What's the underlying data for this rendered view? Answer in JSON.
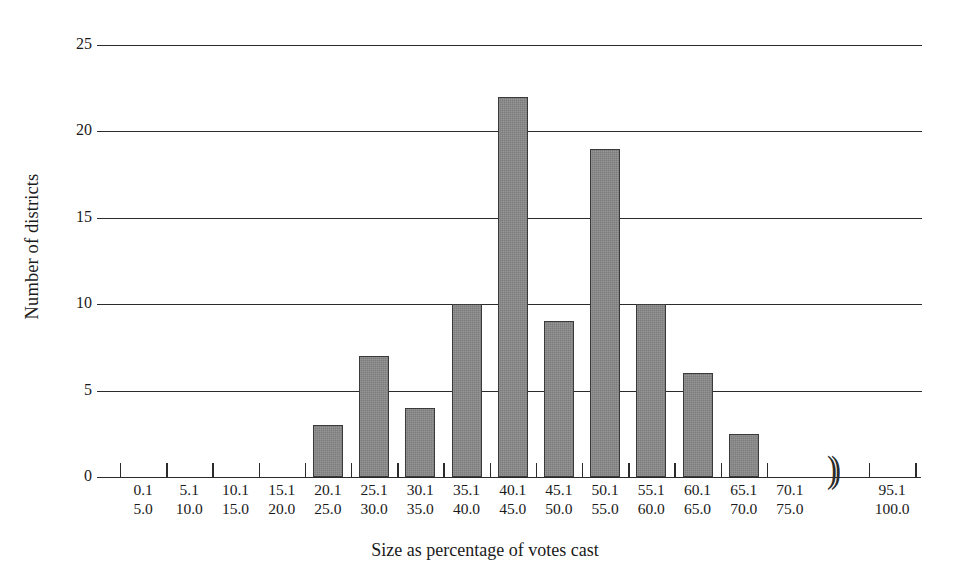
{
  "chart_data": {
    "type": "bar",
    "title": "",
    "xlabel": "Size as percentage of votes cast",
    "ylabel": "Number of districts",
    "ylim": [
      0,
      25
    ],
    "yticks": [
      0,
      5,
      10,
      15,
      20,
      25
    ],
    "grid": true,
    "legend": null,
    "axis_break": {
      "symbol": "))",
      "between": [
        "70.1–75.0",
        "95.1–100.0"
      ]
    },
    "categories": [
      "0.1\n5.0",
      "5.1\n10.0",
      "10.1\n15.0",
      "15.1\n20.0",
      "20.1\n25.0",
      "25.1\n30.0",
      "30.1\n35.0",
      "35.1\n40.0",
      "40.1\n45.0",
      "45.1\n50.0",
      "50.1\n55.0",
      "55.1\n60.0",
      "60.1\n65.0",
      "65.1\n70.0",
      "70.1\n75.0",
      "95.1\n100.0"
    ],
    "values": [
      0,
      0,
      0,
      0,
      3,
      7,
      4,
      10,
      22,
      9,
      19,
      10,
      6,
      2.5,
      0,
      0
    ],
    "bins": [
      {
        "lower": "0.1",
        "upper": "5.0",
        "value": 0
      },
      {
        "lower": "5.1",
        "upper": "10.0",
        "value": 0
      },
      {
        "lower": "10.1",
        "upper": "15.0",
        "value": 0
      },
      {
        "lower": "15.1",
        "upper": "20.0",
        "value": 0
      },
      {
        "lower": "20.1",
        "upper": "25.0",
        "value": 3
      },
      {
        "lower": "25.1",
        "upper": "30.0",
        "value": 7
      },
      {
        "lower": "30.1",
        "upper": "35.0",
        "value": 4
      },
      {
        "lower": "35.1",
        "upper": "40.0",
        "value": 10
      },
      {
        "lower": "40.1",
        "upper": "45.0",
        "value": 22
      },
      {
        "lower": "45.1",
        "upper": "50.0",
        "value": 9
      },
      {
        "lower": "50.1",
        "upper": "55.0",
        "value": 19
      },
      {
        "lower": "55.1",
        "upper": "60.0",
        "value": 10
      },
      {
        "lower": "60.1",
        "upper": "65.0",
        "value": 6
      },
      {
        "lower": "65.1",
        "upper": "70.0",
        "value": 2.5
      },
      {
        "lower": "70.1",
        "upper": "75.0",
        "value": 0
      },
      {
        "lower": "95.1",
        "upper": "100.0",
        "value": 0
      }
    ],
    "colors": {
      "bar_fill": "#7c7c7c",
      "bar_stroke": "#3a3a3a",
      "axis": "#2b2b2b",
      "grid": "#2b2b2b",
      "background": "#ffffff",
      "text": "#1a1a1a"
    }
  }
}
